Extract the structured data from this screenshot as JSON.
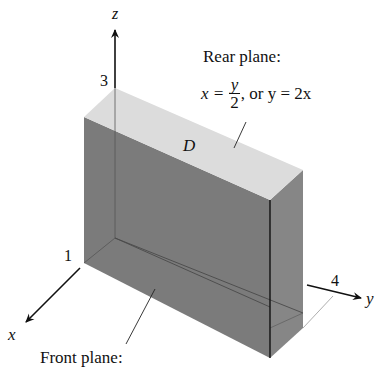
{
  "figure": {
    "type": "3d-solid-region",
    "region_label": "D",
    "axes": {
      "x": {
        "label": "x",
        "tick": "1"
      },
      "y": {
        "label": "y",
        "tick": "4"
      },
      "z": {
        "label": "z",
        "tick": "3"
      }
    },
    "annotations": {
      "rear_plane": {
        "title": "Rear plane:",
        "eq_lhs": "x =",
        "frac_num": "y",
        "frac_den": "2",
        "eq_rest": ", or y = 2x"
      },
      "front_plane": {
        "title": "Front plane:"
      }
    },
    "colors": {
      "top_face": "#dcdcdc",
      "front_face": "#7a7a7a",
      "side_face": "#858585",
      "axis": "#111111"
    }
  }
}
